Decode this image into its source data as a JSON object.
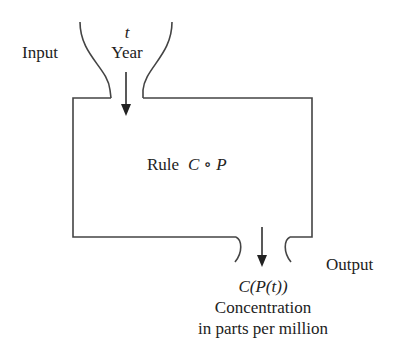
{
  "input": {
    "label": "Input",
    "variable": "t",
    "description": "Year"
  },
  "machine": {
    "rule_word": "Rule",
    "rule_expr": "C ∘ P"
  },
  "output": {
    "label": "Output",
    "expression": "C(P(t))",
    "description_line1": "Concentration",
    "description_line2": "in parts per million"
  },
  "colors": {
    "line": "#444444",
    "text": "#222222",
    "background": "#ffffff"
  }
}
